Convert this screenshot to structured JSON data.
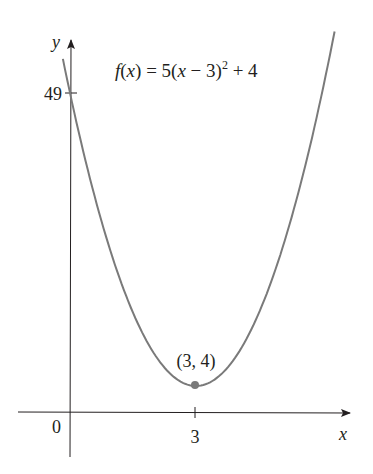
{
  "chart_data": {
    "type": "line",
    "title": "",
    "function_label": {
      "f": "f",
      "x_open": "(",
      "x": "x",
      "x_close": ")",
      "rhs_pre": " = 5(",
      "rhs_x": "x",
      "rhs_mid": " − 3)",
      "exp": "2",
      "rhs_post": " + 4"
    },
    "formula": "f(x) = 5(x − 3)^2 + 4",
    "xlabel": "x",
    "ylabel": "y",
    "x_ticks": [
      {
        "value": 3,
        "label": "3"
      }
    ],
    "y_ticks": [
      {
        "value": 49,
        "label": "49"
      }
    ],
    "origin_label": "0",
    "series": [
      {
        "name": "f(x) = 5(x − 3)^2 + 4",
        "x": [
          -0.17,
          0,
          0.5,
          1,
          1.5,
          2,
          2.5,
          3,
          3.5,
          4,
          4.5,
          5,
          5.5,
          6,
          6.3
        ],
        "values": [
          54.2,
          49,
          35.25,
          24,
          15.25,
          9,
          5.25,
          4,
          5.25,
          9,
          15.25,
          24,
          35.25,
          49,
          58.45
        ]
      }
    ],
    "points": [
      {
        "x": 3,
        "y": 4,
        "label": "(3, 4)"
      }
    ],
    "xlim": [
      -1.2,
      6.8
    ],
    "ylim": [
      -7,
      57
    ],
    "grid": false,
    "legend": "none",
    "colors": {
      "curve": "#7a7a7a",
      "axis": "#231f20",
      "point": "#7a7a7a",
      "text": "#231f20"
    }
  }
}
